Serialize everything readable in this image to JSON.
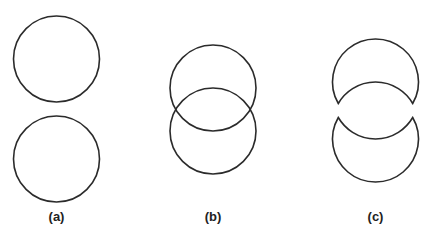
{
  "figure": {
    "panels": [
      {
        "id": "a",
        "label": "(a)",
        "description": "Two separate circles stacked vertically"
      },
      {
        "id": "b",
        "label": "(b)",
        "description": "Two overlapping circles"
      },
      {
        "id": "c",
        "label": "(c)",
        "description": "Overlapping circles split into two crescent pieces"
      }
    ],
    "stroke_color": "#2b2b2b",
    "background": "#ffffff"
  }
}
